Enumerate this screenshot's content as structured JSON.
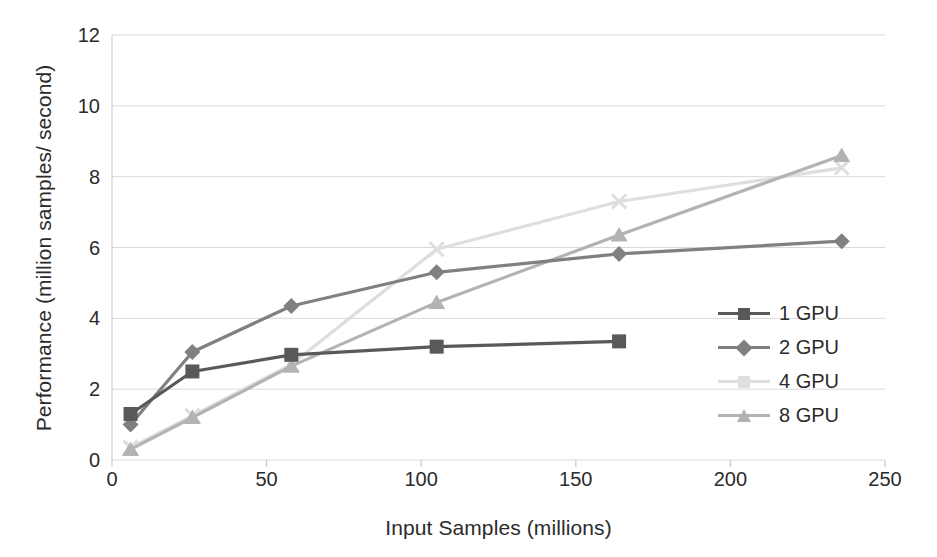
{
  "chart_data": {
    "type": "line",
    "title": "",
    "subtitle": "",
    "xlabel": "Input Samples (millions)",
    "ylabel": "Performance (million samples/ second)",
    "xlim": [
      0,
      250
    ],
    "ylim": [
      0,
      12
    ],
    "xticks": [
      0,
      50,
      100,
      150,
      200,
      250
    ],
    "yticks": [
      0,
      2,
      4,
      6,
      8,
      10,
      12
    ],
    "grid": true,
    "legend_position": "right-inside",
    "series": [
      {
        "name": "1 GPU",
        "color": "#595959",
        "marker": "square",
        "x": [
          6,
          26,
          58,
          105,
          164
        ],
        "y": [
          1.3,
          2.5,
          2.97,
          3.2,
          3.35
        ]
      },
      {
        "name": "2 GPU",
        "color": "#808080",
        "marker": "diamond",
        "x": [
          6,
          26,
          58,
          105,
          164,
          236
        ],
        "y": [
          1.0,
          3.05,
          4.35,
          5.3,
          5.82,
          6.18
        ]
      },
      {
        "name": "4 GPU",
        "color": "#dedede",
        "marker": "x",
        "x": [
          6,
          26,
          58,
          105,
          164,
          236
        ],
        "y": [
          0.35,
          1.25,
          2.7,
          5.95,
          7.3,
          8.25
        ]
      },
      {
        "name": "8 GPU",
        "color": "#b3b3b3",
        "marker": "triangle",
        "x": [
          6,
          26,
          58,
          105,
          164,
          236
        ],
        "y": [
          0.3,
          1.2,
          2.65,
          4.45,
          6.35,
          8.6
        ]
      }
    ]
  },
  "legend": {
    "items": [
      {
        "label": "1 GPU"
      },
      {
        "label": "2 GPU"
      },
      {
        "label": "4 GPU"
      },
      {
        "label": "8 GPU"
      }
    ]
  }
}
